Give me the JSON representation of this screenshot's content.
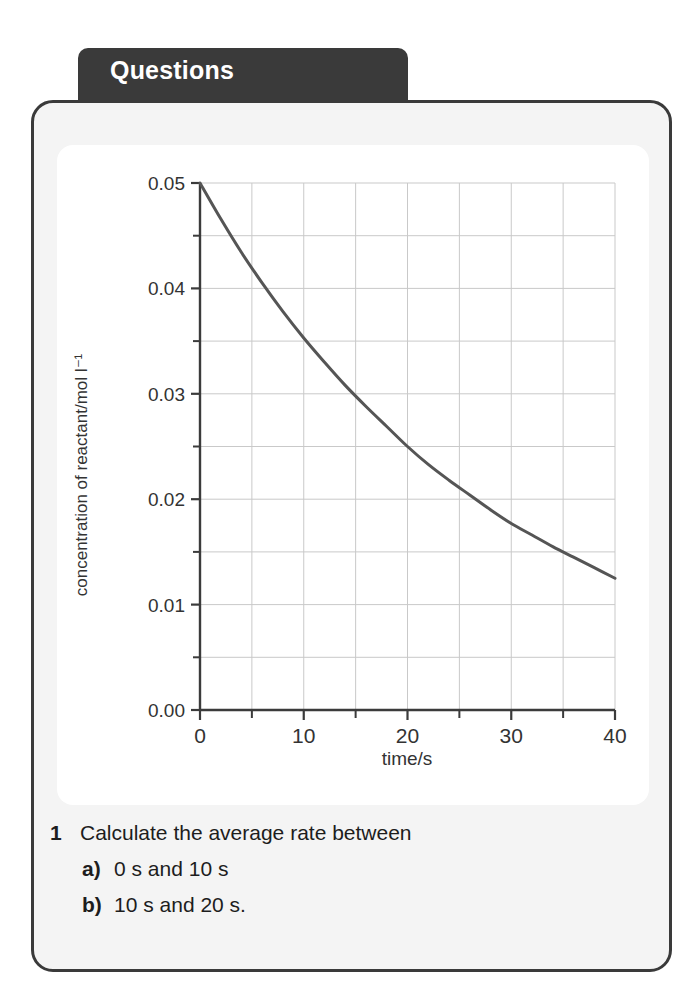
{
  "tab": {
    "label": "Questions"
  },
  "chart_data": {
    "type": "line",
    "title": "",
    "xlabel": "time/s",
    "ylabel": "concentration of reactant/mol l⁻¹",
    "xlim": [
      0,
      40
    ],
    "ylim": [
      0.0,
      0.05
    ],
    "xticks": [
      0,
      10,
      20,
      30,
      40
    ],
    "xtick_labels": [
      "0",
      "10",
      "20",
      "30",
      "40"
    ],
    "xminor_step": 5,
    "yticks": [
      0.0,
      0.01,
      0.02,
      0.03,
      0.04,
      0.05
    ],
    "ytick_labels": [
      "0.00",
      "0.01",
      "0.02",
      "0.03",
      "0.04",
      "0.05"
    ],
    "yminor_step": 0.005,
    "grid": true,
    "grid_color": "#c9c9c9",
    "legend": false,
    "line_color": "#555555",
    "line_width": 3,
    "x": [
      0,
      2,
      4,
      6,
      8,
      10,
      12,
      14,
      16,
      18,
      20,
      22,
      24,
      26,
      28,
      30,
      32,
      34,
      36,
      38,
      40
    ],
    "y": [
      0.05,
      0.0466,
      0.0434,
      0.0405,
      0.0378,
      0.0353,
      0.033,
      0.0308,
      0.0288,
      0.0269,
      0.025,
      0.0233,
      0.0218,
      0.0204,
      0.019,
      0.0177,
      0.0166,
      0.0155,
      0.0145,
      0.0135,
      0.0125
    ],
    "annotation": "exponential decay of reactant concentration"
  },
  "questions": {
    "number": "1",
    "stem": "Calculate the average rate between",
    "parts": [
      {
        "marker": "a)",
        "text": "0 s and 10 s"
      },
      {
        "marker": "b)",
        "text": "10 s and 20 s."
      }
    ]
  }
}
